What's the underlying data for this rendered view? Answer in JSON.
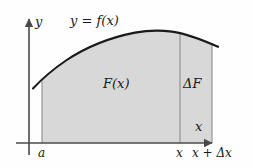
{
  "figure": {
    "kind": "calculus-diagram",
    "colors": {
      "background": "#fefefe",
      "region_fill": "#d8d8d8",
      "region_stroke": "#8c8c8c",
      "curve": "#1a1a1a",
      "axis": "#4a4a4a",
      "text": "#1a1a1a"
    }
  },
  "axes": {
    "y_label": "y",
    "x_label": "x",
    "origin_x": 29,
    "origin_y": 143,
    "y_axis_top": 18,
    "x_axis_right": 214
  },
  "curve": {
    "equation_label": "y = f(x)",
    "points": [
      [
        33,
        88
      ],
      [
        50,
        72
      ],
      [
        70,
        58
      ],
      [
        95,
        46
      ],
      [
        120,
        37
      ],
      [
        145,
        32
      ],
      [
        162,
        31
      ],
      [
        180,
        33
      ],
      [
        198,
        39
      ],
      [
        218,
        47
      ]
    ]
  },
  "regions": [
    {
      "name": "accumulated-area",
      "label": "F(x)",
      "left_x": 42,
      "right_x": 180
    },
    {
      "name": "increment-strip",
      "label": "ΔF",
      "left_x": 180,
      "right_x": 212
    }
  ],
  "ticks": [
    {
      "name": "a",
      "label": "a",
      "x": 42
    },
    {
      "name": "x",
      "label": "x",
      "x": 180
    },
    {
      "name": "x-plus-delta-x",
      "label": "x + Δx",
      "x": 212
    }
  ]
}
